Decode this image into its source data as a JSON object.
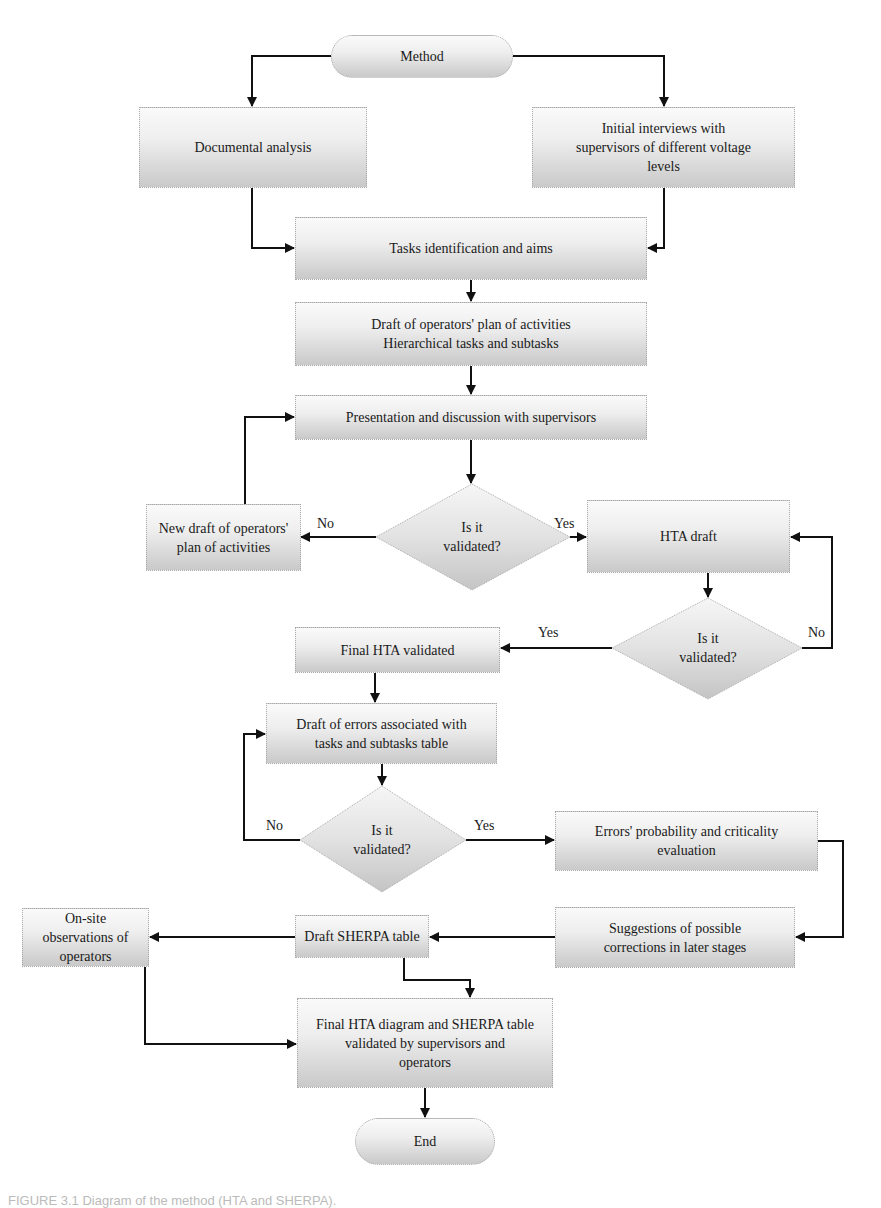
{
  "diagram": {
    "type": "flowchart",
    "nodes": {
      "start": "Method",
      "documental": "Documental analysis",
      "interviews": "Initial interviews with\nsupervisors of different voltage\nlevels",
      "tasks": "Tasks identification and aims",
      "draft_plan": "Draft of operators' plan of activities\nHierarchical tasks and subtasks",
      "presentation": "Presentation and discussion with supervisors",
      "decision1": "Is it\nvalidated?",
      "new_draft": "New draft of operators'\nplan of activities",
      "hta_draft": "HTA draft",
      "decision2": "Is it\nvalidated?",
      "final_hta": "Final HTA validated",
      "draft_errors": "Draft of errors associated with\ntasks and subtasks table",
      "decision3": "Is it\nvalidated?",
      "errors_prob": "Errors' probability and criticality\nevaluation",
      "suggestions": "Suggestions of possible\ncorrections in later stages",
      "draft_sherpa": "Draft SHERPA table",
      "onsite": "On-site observations of\noperators",
      "final_diagram": "Final HTA diagram and SHERPA table\nvalidated by supervisors and\noperators",
      "end": "End"
    },
    "edge_labels": {
      "d1_no": "No",
      "d1_yes": "Yes",
      "d2_yes": "Yes",
      "d2_no": "No",
      "d3_no": "No",
      "d3_yes": "Yes"
    },
    "edges": [
      {
        "from": "start",
        "to": "documental"
      },
      {
        "from": "start",
        "to": "interviews"
      },
      {
        "from": "documental",
        "to": "tasks"
      },
      {
        "from": "interviews",
        "to": "tasks"
      },
      {
        "from": "tasks",
        "to": "draft_plan"
      },
      {
        "from": "draft_plan",
        "to": "presentation"
      },
      {
        "from": "presentation",
        "to": "decision1"
      },
      {
        "from": "decision1",
        "to": "new_draft",
        "label": "No"
      },
      {
        "from": "decision1",
        "to": "hta_draft",
        "label": "Yes"
      },
      {
        "from": "new_draft",
        "to": "presentation"
      },
      {
        "from": "hta_draft",
        "to": "decision2"
      },
      {
        "from": "decision2",
        "to": "final_hta",
        "label": "Yes"
      },
      {
        "from": "decision2",
        "to": "hta_draft",
        "label": "No"
      },
      {
        "from": "final_hta",
        "to": "draft_errors"
      },
      {
        "from": "draft_errors",
        "to": "decision3"
      },
      {
        "from": "decision3",
        "to": "draft_errors",
        "label": "No"
      },
      {
        "from": "decision3",
        "to": "errors_prob",
        "label": "Yes"
      },
      {
        "from": "errors_prob",
        "to": "suggestions"
      },
      {
        "from": "suggestions",
        "to": "draft_sherpa"
      },
      {
        "from": "draft_sherpa",
        "to": "onsite"
      },
      {
        "from": "draft_sherpa",
        "to": "final_diagram"
      },
      {
        "from": "onsite",
        "to": "final_diagram"
      },
      {
        "from": "final_diagram",
        "to": "end"
      }
    ]
  },
  "caption": "FIGURE 3.1  Diagram of the method (HTA and SHERPA)."
}
